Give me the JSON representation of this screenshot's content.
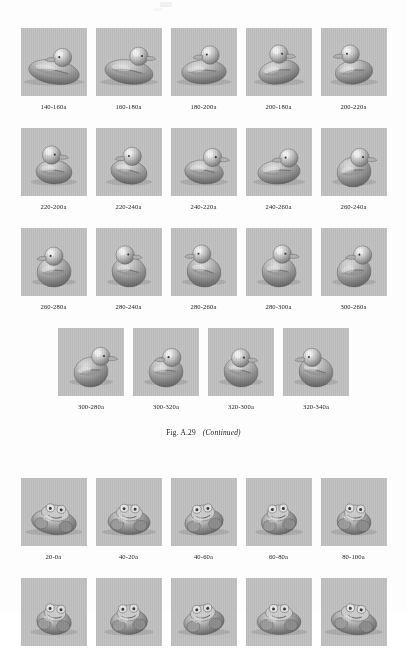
{
  "page": {
    "background_color": "#fdfdfd",
    "thumb_background": "#c3c3c3",
    "text_color": "#1a1a1a"
  },
  "figure_a29": {
    "caption_prefix": "Fig. A.29",
    "caption_suffix": "(Continued)",
    "object": "rubber-duck",
    "rows": [
      {
        "row_index": 1,
        "cells": [
          {
            "label": "140-160a"
          },
          {
            "label": "160-180a"
          },
          {
            "label": "180-200a"
          },
          {
            "label": "200-180a"
          },
          {
            "label": "200-220a"
          }
        ]
      },
      {
        "row_index": 2,
        "cells": [
          {
            "label": "220-200a"
          },
          {
            "label": "220-240a"
          },
          {
            "label": "240-220a"
          },
          {
            "label": "240-260a"
          },
          {
            "label": "260-240a"
          }
        ]
      },
      {
        "row_index": 3,
        "cells": [
          {
            "label": "260-280a"
          },
          {
            "label": "280-240a"
          },
          {
            "label": "280-260a"
          },
          {
            "label": "280-300a"
          },
          {
            "label": "300-260a"
          }
        ]
      },
      {
        "row_index": 4,
        "cells": [
          {
            "label": "300-280a"
          },
          {
            "label": "300-320a"
          },
          {
            "label": "320-300a"
          },
          {
            "label": "320-340a"
          }
        ]
      }
    ]
  },
  "figure_next": {
    "object": "frog-figurine",
    "rows": [
      {
        "row_index": 1,
        "cells": [
          {
            "label": "20-0a"
          },
          {
            "label": "40-20a"
          },
          {
            "label": "40-60a"
          },
          {
            "label": "60-80a"
          },
          {
            "label": "80-100a"
          }
        ]
      },
      {
        "row_index": 2,
        "clipped": true,
        "cells": [
          {
            "label": ""
          },
          {
            "label": ""
          },
          {
            "label": ""
          },
          {
            "label": ""
          },
          {
            "label": ""
          }
        ]
      }
    ]
  }
}
